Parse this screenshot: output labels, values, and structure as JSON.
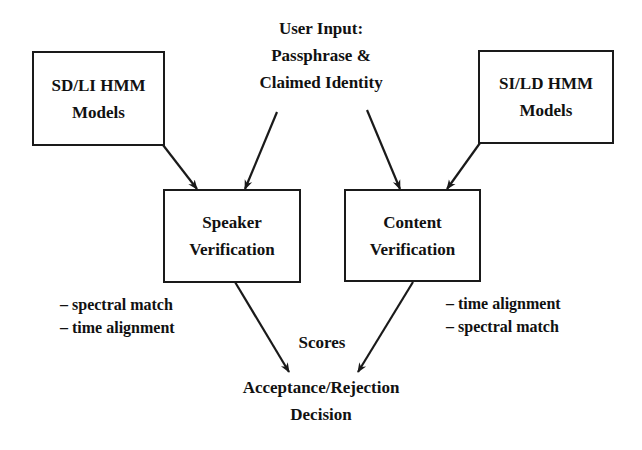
{
  "diagram": {
    "input": {
      "lines": [
        "User Input:",
        "Passphrase &",
        "Claimed Identity"
      ]
    },
    "boxes": {
      "sd_li_models": {
        "lines": [
          "SD/LI HMM",
          "Models"
        ]
      },
      "si_ld_models": {
        "lines": [
          "SI/LD HMM",
          "Models"
        ]
      },
      "speaker_verification": {
        "lines": [
          "Speaker",
          "Verification"
        ]
      },
      "content_verification": {
        "lines": [
          "Content",
          "Verification"
        ]
      }
    },
    "notes": {
      "speaker": [
        "– spectral match",
        "– time alignment"
      ],
      "content": [
        "– time alignment",
        "– spectral match"
      ]
    },
    "scores_label": "Scores",
    "output": {
      "lines": [
        "Acceptance/Rejection",
        "Decision"
      ]
    },
    "edges": [
      {
        "from": "SD/LI HMM Models",
        "to": "Speaker Verification"
      },
      {
        "from": "User Input",
        "to": "Speaker Verification"
      },
      {
        "from": "User Input",
        "to": "Content Verification"
      },
      {
        "from": "SI/LD HMM Models",
        "to": "Content Verification"
      },
      {
        "from": "Speaker Verification",
        "to": "Acceptance/Rejection Decision"
      },
      {
        "from": "Content Verification",
        "to": "Acceptance/Rejection Decision"
      }
    ],
    "colors": {
      "stroke": "#1a1a1a",
      "background": "#ffffff"
    }
  }
}
